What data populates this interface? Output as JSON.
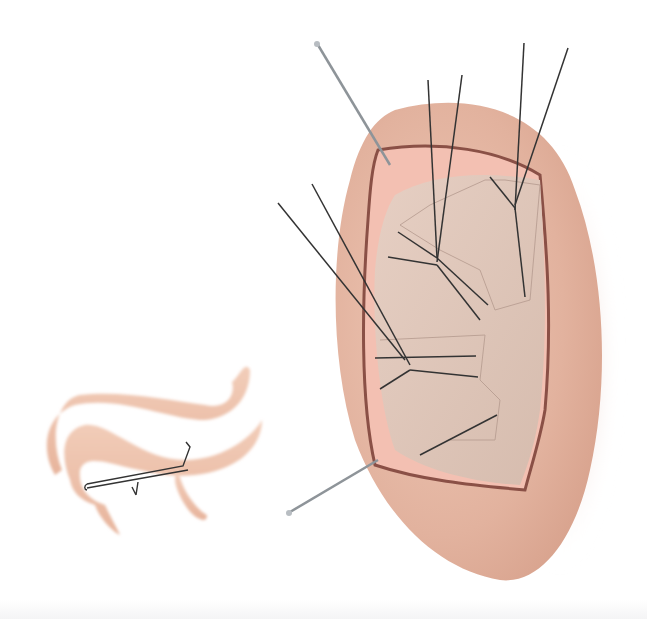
{
  "figure": {
    "title": "Surgical illustration: ear cartilage graft with sutures and pins",
    "colors": {
      "skin_outer": "#e3b7a3",
      "skin_inner": "#f1c6b6",
      "graft": "#dcc3b6",
      "flap_edge": "#f7b9ae",
      "outline": "#7a4a40",
      "suture": "#333333",
      "pin": "#9aa0a6",
      "cartilage_strip": "#f0c7b3"
    },
    "parts": [
      {
        "name": "auricle",
        "label": "Ear (auricle) with recipient bed"
      },
      {
        "name": "cartilage-graft",
        "label": "Cartilage graft"
      },
      {
        "name": "sutures",
        "label": "Bolster sutures"
      },
      {
        "name": "pins",
        "label": "Retaining pins"
      },
      {
        "name": "cartilage-strip",
        "label": "Folded cartilage strip with suture"
      }
    ]
  }
}
